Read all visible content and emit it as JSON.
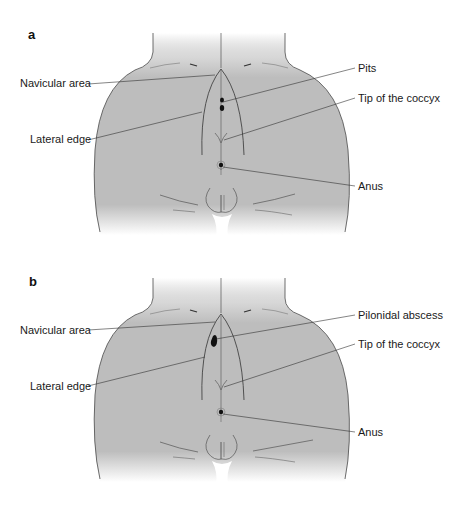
{
  "panels": [
    {
      "id": "a",
      "letter": "a",
      "labels": {
        "navicular": "Navicular area",
        "lateral": "Lateral edge",
        "finding": "Pits",
        "coccyx": "Tip of the coccyx",
        "anus": "Anus"
      }
    },
    {
      "id": "b",
      "letter": "b",
      "labels": {
        "navicular": "Navicular area",
        "lateral": "Lateral edge",
        "finding": "Pilonidal abscess",
        "coccyx": "Tip of the coccyx",
        "anus": "Anus"
      }
    }
  ],
  "colors": {
    "skin": "#bdbdbd",
    "outline": "#4a4a4a",
    "leader": "#333333",
    "lesion": "#111111"
  }
}
